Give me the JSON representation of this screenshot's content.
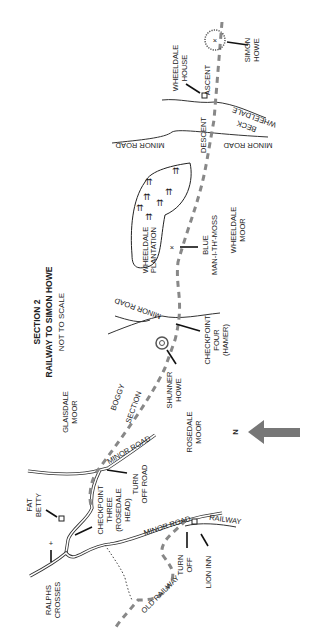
{
  "map": {
    "title": "SECTION 2",
    "subtitle": "RAILWAY TO SIMON HOWE",
    "scale_note": "NOT TO SCALE",
    "north_label": "N",
    "orientation": "rotated 90° counter-clockwise; north points left",
    "colors": {
      "route": "#888888",
      "north_arrow": "#777777",
      "ink": "#222222"
    },
    "labels": {
      "simon_howe": [
        "SIMON",
        "HOWE"
      ],
      "wheeldale_house": [
        "WHEELDALE",
        "HOUSE"
      ],
      "ascent": "ASCENT",
      "descent": "DESCENT",
      "wheeldale_beck": [
        "WHEELDALE",
        "BECK"
      ],
      "minor_road_top_left": "MINOR ROAD",
      "minor_road_top_right": "MINOR ROAD",
      "wheeldale_plantation": [
        "WHEELDALE",
        "PLANTATION"
      ],
      "blue_man": [
        "BLUE",
        "MAN-I-TH'-MOSS"
      ],
      "wheeldale_moor": [
        "WHEELDALE",
        "MOOR"
      ],
      "minor_road_mid": "MINOR ROAD",
      "checkpoint_four": [
        "CHECKPOINT",
        "FOUR",
        "(HAMER)"
      ],
      "shunner_howe": [
        "SHUNNER",
        "HOWE"
      ],
      "boggy_section": [
        "BOGGY",
        "SECTION"
      ],
      "glaisdale_moor": [
        "GLAISDALE",
        "MOOR"
      ],
      "rosedale_moor": [
        "ROSEDALE",
        "MOOR"
      ],
      "minor_road_low": "MINOR ROAD",
      "turn_off_road": [
        "TURN",
        "OFF ROAD"
      ],
      "fat_betty": [
        "FAT",
        "BETTY"
      ],
      "checkpoint_three": [
        "CHECKPOINT",
        "THREE",
        "(ROSEDALE",
        "HEAD)"
      ],
      "minor_road_bottom": "MINOR ROAD",
      "railway": "RAILWAY",
      "turn_off": [
        "TURN",
        "OFF"
      ],
      "lion_inn": "LION INN",
      "ralphs_crosses": [
        "RALPHS",
        "CROSSES"
      ],
      "old_railway": "OLD RAILWAY"
    }
  }
}
